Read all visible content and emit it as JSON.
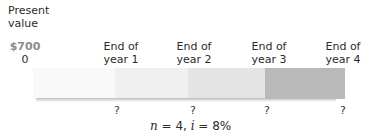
{
  "diagram": {
    "present_value": {
      "title_line1": "Present",
      "title_line2": "value",
      "amount": "$700",
      "period": "0"
    },
    "periods": [
      {
        "line1": "End of",
        "line2": "year 1",
        "value": "?"
      },
      {
        "line1": "End of",
        "line2": "year 2",
        "value": "?"
      },
      {
        "line1": "End of",
        "line2": "year 3",
        "value": "?"
      },
      {
        "line1": "End of",
        "line2": "year 4",
        "value": "?"
      }
    ],
    "segments": [
      {
        "color": "#f9f9f9",
        "width": 82
      },
      {
        "color": "#f0f0f0",
        "width": 73
      },
      {
        "color": "#e6e6e6",
        "width": 77
      },
      {
        "color": "#b9b9b9",
        "width": 80
      }
    ],
    "formula": {
      "n_var": "n",
      "n_eq": " = 4, ",
      "i_var": "i",
      "i_eq": " = 8%"
    }
  }
}
